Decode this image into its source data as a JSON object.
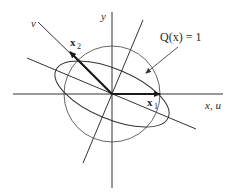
{
  "diagram": {
    "type": "quadratic-form-level-set",
    "axes": {
      "horizontal_label": "x, u",
      "vertical_label": "y",
      "rotated_axis_label": "v"
    },
    "vectors": [
      {
        "name": "x1",
        "label_main": "x",
        "label_sub": "1"
      },
      {
        "name": "x2",
        "label_main": "x",
        "label_sub": "2"
      }
    ],
    "annotation": {
      "label": "Q(x) = 1"
    },
    "shapes": [
      "unit circle",
      "ellipse Q(x) = 1"
    ],
    "colors": {
      "stroke": "#2a2a2a",
      "thin_stroke": "#555555",
      "background": "#ffffff"
    }
  }
}
